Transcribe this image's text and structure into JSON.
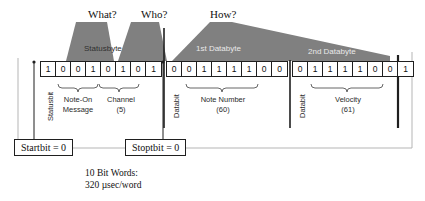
{
  "figure": {
    "title_questions": [
      {
        "id": "what",
        "label": "What?"
      },
      {
        "id": "who",
        "label": "Who?"
      },
      {
        "id": "how",
        "label": "How?"
      }
    ],
    "byte_captions": [
      {
        "id": "statusbyte",
        "label": "Statusbyte"
      },
      {
        "id": "first-databyte",
        "label": "1st Databyte"
      },
      {
        "id": "second-databyte",
        "label": "2nd Databyte"
      }
    ],
    "bytes": [
      {
        "id": "statusbyte",
        "caption": "Statusbyte",
        "bits": [
          "1",
          "0",
          "0",
          "1",
          "0",
          "1",
          "0",
          "1"
        ],
        "start_marker": "Statusbit",
        "groups": [
          {
            "id": "note-on-message",
            "line1": "Note-On",
            "line2": "Message"
          },
          {
            "id": "channel",
            "line1": "Channel",
            "line2": "(5)"
          }
        ]
      },
      {
        "id": "first-databyte",
        "caption": "1st Databyte",
        "bits": [
          "0",
          "0",
          "1",
          "1",
          "1",
          "1",
          "0",
          "0"
        ],
        "start_marker": "Databit",
        "groups": [
          {
            "id": "note-number",
            "line1": "Note Number",
            "line2": "(60)"
          }
        ]
      },
      {
        "id": "second-databyte",
        "caption": "2nd Databyte",
        "bits": [
          "0",
          "1",
          "1",
          "1",
          "1",
          "0",
          "0",
          "1"
        ],
        "start_marker": "Databit",
        "groups": [
          {
            "id": "velocity",
            "line1": "Velocity",
            "line2": "(61)"
          }
        ]
      }
    ],
    "callouts": [
      {
        "id": "startbit",
        "label": "Startbit = 0"
      },
      {
        "id": "stoptbit",
        "label": "Stoptbit = 0"
      }
    ],
    "footnote": {
      "line1": "10 Bit Words:",
      "line2": "320 µsec/word"
    },
    "colors": {
      "wedge_fill": "#808080",
      "line": "#1f1f1f",
      "page_background": "#ffffff",
      "outer_frame": "#9a9a9a"
    }
  }
}
